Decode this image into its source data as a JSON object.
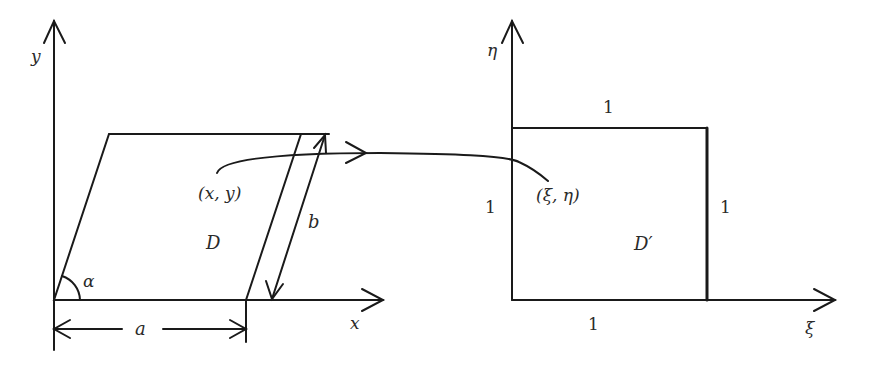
{
  "left_figure": {
    "x_axis_label": "x",
    "y_axis_label": "y",
    "region_label": "D",
    "point_label": "(x, y)",
    "angle_label": "α",
    "base_dimension_label": "a",
    "slant_dimension_label": "b"
  },
  "right_figure": {
    "xi_axis_label": "ξ",
    "eta_axis_label": "η",
    "region_label": "D′",
    "point_label": "(ξ, η)",
    "top_side_label": "1",
    "left_side_label": "1",
    "right_side_label": "1",
    "bottom_side_label": "1"
  },
  "colors": {
    "stroke": "#1a1a1a",
    "text": "#2a2a2a",
    "background": "#ffffff"
  }
}
